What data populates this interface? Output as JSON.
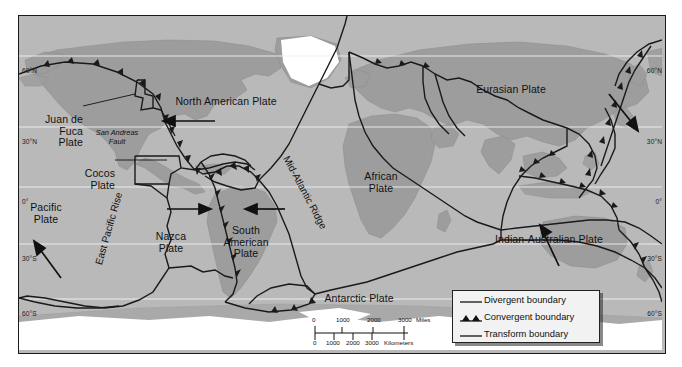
{
  "map": {
    "title": "World Tectonic Plates Map",
    "ocean_color": "#b9b9b9",
    "land_color": "#9a9a9a",
    "ice_color": "#ffffff",
    "boundary_color": "#1a1a1a",
    "graticule_color": "#f0f0f0",
    "frame_color": "#1a1a1a"
  },
  "latitudes": {
    "left": [
      {
        "label": "60°N",
        "y": 55
      },
      {
        "label": "30°N",
        "y": 126
      },
      {
        "label": "0°",
        "y": 186
      },
      {
        "label": "30°S",
        "y": 243
      },
      {
        "label": "60°S",
        "y": 298
      }
    ],
    "right": [
      {
        "label": "60°N",
        "y": 55
      },
      {
        "label": "30°N",
        "y": 126
      },
      {
        "label": "0°",
        "y": 186
      },
      {
        "label": "30°S",
        "y": 243
      },
      {
        "label": "60°S",
        "y": 298
      }
    ]
  },
  "plates": [
    {
      "name": "North American Plate",
      "x": 147,
      "y": 80,
      "w": 120,
      "align": "center"
    },
    {
      "name": "Eurasian Plate",
      "x": 447,
      "y": 68,
      "w": 90,
      "align": "center"
    },
    {
      "name": "Juan de\nFuca\nPlate",
      "x": 17,
      "y": 98,
      "w": 62,
      "align": "right"
    },
    {
      "name": "Cocos\nPlate",
      "x": 108,
      "y": 152,
      "w": 48,
      "align": "right"
    },
    {
      "name": "Pacific\nPlate",
      "x": 4,
      "y": 186,
      "w": 54,
      "align": "center"
    },
    {
      "name": "Nazca\nPlate",
      "x": 148,
      "y": 215,
      "w": 48,
      "align": "center"
    },
    {
      "name": "South\nAmerican\nPlate",
      "x": 213,
      "y": 209,
      "w": 62,
      "align": "center"
    },
    {
      "name": "African\nPlate",
      "x": 355,
      "y": 160,
      "w": 56,
      "align": "center"
    },
    {
      "name": "Indian-Australian Plate",
      "x": 485,
      "y": 218,
      "w": 130,
      "align": "center"
    },
    {
      "name": "Antarctic Plate",
      "x": 320,
      "y": 292,
      "w": 90,
      "align": "center"
    }
  ],
  "features": [
    {
      "name": "Mid-Atlantic Ridge",
      "x": 298,
      "y": 155,
      "rotate": 62
    },
    {
      "name": "East Pacific Rise",
      "x": 95,
      "y": 190,
      "rotate": -74
    },
    {
      "name": "San Andreas\nFault",
      "x": 98,
      "y": 122
    }
  ],
  "legend": {
    "items": [
      {
        "label": "Divergent boundary",
        "symbol": "line"
      },
      {
        "label": "Convergent boundary",
        "symbol": "line-triangles"
      },
      {
        "label": "Transform boundary",
        "symbol": "line"
      }
    ]
  },
  "scale": {
    "miles": {
      "ticks": [
        "0",
        "1000",
        "2000",
        "3000"
      ],
      "unit": "Miles"
    },
    "kilometers": {
      "ticks": [
        "0",
        "1000",
        "2000",
        "3000"
      ],
      "unit": "Kilometers"
    }
  }
}
